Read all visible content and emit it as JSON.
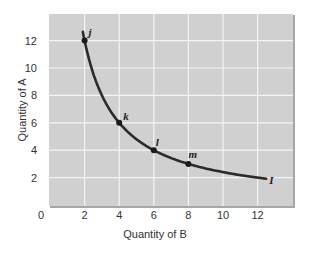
{
  "chart_data": {
    "type": "line",
    "title": "",
    "xlabel": "Quantity of B",
    "ylabel": "Quantity of A",
    "xlim": [
      0,
      14
    ],
    "ylim": [
      0,
      14
    ],
    "x_ticks": [
      0,
      2,
      4,
      6,
      8,
      10,
      12
    ],
    "y_ticks": [
      0,
      2,
      4,
      6,
      8,
      10,
      12
    ],
    "grid": true,
    "legend": null,
    "series": [
      {
        "name": "I",
        "description": "Indifference curve A = 24 / B",
        "x": [
          1.9,
          2,
          3,
          4,
          5,
          6,
          7,
          8,
          9,
          10,
          11,
          12.5
        ],
        "y": [
          12.6,
          12,
          8,
          6,
          4.8,
          4,
          3.43,
          3,
          2.67,
          2.4,
          2.18,
          1.92
        ]
      }
    ],
    "points": [
      {
        "label": "j",
        "x": 2,
        "y": 12
      },
      {
        "label": "k",
        "x": 4,
        "y": 6
      },
      {
        "label": "l",
        "x": 6,
        "y": 4
      },
      {
        "label": "m",
        "x": 8,
        "y": 3
      }
    ],
    "curve_label": "I"
  },
  "colors": {
    "plot_bg": "#d0d0d0",
    "grid": "#f4f4f4",
    "border": "#a6a6a6",
    "curve": "#2b2b2b"
  }
}
